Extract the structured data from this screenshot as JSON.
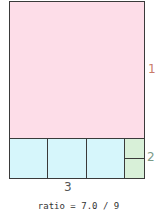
{
  "diagram": {
    "labels": {
      "pink": "1",
      "green": "2",
      "cyan": "3"
    },
    "ratio_text": "ratio = 7.0 / 9",
    "colors": {
      "pink": "#fddde8",
      "cyan": "#d6f6fb",
      "green": "#d8f0d8",
      "border": "#3a3a3a"
    }
  }
}
